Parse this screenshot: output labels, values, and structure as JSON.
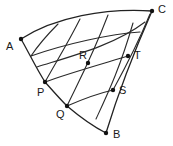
{
  "figure": {
    "kind": "geometric-curvilinear-quadrilateral-diagram",
    "background_color": "#ffffff",
    "stroke_color": "#2a2a2a",
    "label_color": "#1a1a1a",
    "width": 173,
    "height": 146
  },
  "points": [
    {
      "id": "A",
      "label": "A",
      "x": 21,
      "y": 39,
      "label_x": 6,
      "label_y": 41
    },
    {
      "id": "C",
      "label": "C",
      "x": 152,
      "y": 11,
      "label_x": 158,
      "label_y": 4
    },
    {
      "id": "T",
      "label": "T",
      "x": 128,
      "y": 56,
      "label_x": 134,
      "label_y": 50
    },
    {
      "id": "R",
      "label": "R",
      "x": 88,
      "y": 63,
      "label_x": 79,
      "label_y": 50
    },
    {
      "id": "P",
      "label": "P",
      "x": 45,
      "y": 82,
      "label_x": 37,
      "label_y": 87
    },
    {
      "id": "S",
      "label": "S",
      "x": 113,
      "y": 90,
      "label_x": 119,
      "label_y": 85
    },
    {
      "id": "Q",
      "label": "Q",
      "x": 67,
      "y": 106,
      "label_x": 56,
      "label_y": 109
    },
    {
      "id": "B",
      "label": "B",
      "x": 106,
      "y": 133,
      "label_x": 113,
      "label_y": 129
    }
  ],
  "curves": {
    "boundary": [
      {
        "name": "arc-A-to-C-top",
        "d": "M 21 39 C 55 17, 105 8, 152 11"
      },
      {
        "name": "edge-A-to-P-left",
        "d": "M 21 39 C 28 51, 36 68, 45 82"
      },
      {
        "name": "arc-P-to-Q",
        "d": "M 45 82 C 53 91, 60 99, 67 106"
      },
      {
        "name": "arc-Q-to-B-bottom",
        "d": "M 67 106 C 80 117, 94 127, 106 133"
      },
      {
        "name": "arc-B-to-C-right",
        "d": "M 106 133 C 113 110, 126 70, 152 11"
      }
    ],
    "transversals": [
      {
        "name": "arc-P-through-R-to-T",
        "d": "M 45 82 C 66 74, 105 63, 128 56"
      },
      {
        "name": "arc-Q-through-to-S",
        "d": "M 67 106 C 83 99, 100 93, 113 90"
      },
      {
        "name": "arc-mid-upper-band",
        "d": "M 31 56 C 65 44, 110 34, 140 32"
      },
      {
        "name": "arc-upper-band-2",
        "d": "M 37 67 C 72 56, 115 45, 145 22"
      }
    ],
    "fanlines": [
      {
        "name": "fanline-left-from-A-region",
        "d": "M 31 56 C 39 44, 48 34, 58 24"
      },
      {
        "name": "fanline-1-from-P",
        "d": "M 45 82 C 56 62, 68 43, 80 19"
      },
      {
        "name": "fanline-2-from-Q",
        "d": "M 67 106 C 78 83, 92 57, 108 15"
      },
      {
        "name": "fanline-3-through-T",
        "d": "M 96 119 C 108 93, 120 68, 133 23"
      },
      {
        "name": "fanline-4-near-C",
        "d": "M 113 90 C 124 70, 136 48, 150 14"
      }
    ]
  }
}
